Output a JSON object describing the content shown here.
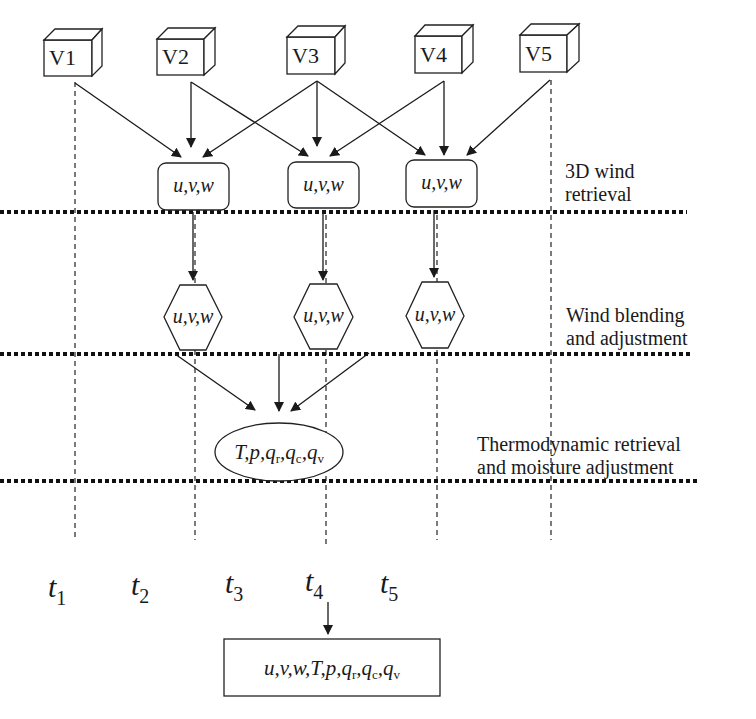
{
  "diagram": {
    "type": "flowchart",
    "volumes": [
      {
        "id": "V1",
        "label": "V1",
        "time": "t1"
      },
      {
        "id": "V2",
        "label": "V2",
        "time": "t2"
      },
      {
        "id": "V3",
        "label": "V3",
        "time": "t3"
      },
      {
        "id": "V4",
        "label": "V4",
        "time": "t4"
      },
      {
        "id": "V5",
        "label": "V5",
        "time": "t5"
      }
    ],
    "wind_retrieval_nodes": [
      {
        "id": "R2",
        "label": "u,v,w",
        "inputs": [
          "V1",
          "V2",
          "V3"
        ]
      },
      {
        "id": "R3",
        "label": "u,v,w",
        "inputs": [
          "V2",
          "V3",
          "V4"
        ]
      },
      {
        "id": "R4",
        "label": "u,v,w",
        "inputs": [
          "V3",
          "V4",
          "V5"
        ]
      }
    ],
    "wind_blending_nodes": [
      {
        "id": "B2",
        "label": "u,v,w",
        "input": "R2"
      },
      {
        "id": "B3",
        "label": "u,v,w",
        "input": "R3"
      },
      {
        "id": "B4",
        "label": "u,v,w",
        "input": "R4"
      }
    ],
    "thermo_node": {
      "id": "TH",
      "label": "T,p,q_r,q_c,q_v",
      "base": "T,p,",
      "q_subs": [
        "r",
        "c",
        "v"
      ],
      "inputs": [
        "B2",
        "B3",
        "B4"
      ]
    },
    "output_node": {
      "id": "OUT",
      "label": "u,v,w,T,p,q_r,q_c,q_v",
      "base": "u,v,w,T,p,",
      "q_subs": [
        "r",
        "c",
        "v"
      ],
      "input": "t3"
    },
    "stages": [
      {
        "line1": "3D wind",
        "line2": "retrieval"
      },
      {
        "line1": "Wind blending",
        "line2": "and adjustment"
      },
      {
        "line1": "Thermodynamic retrieval",
        "line2": "and moisture adjustment"
      }
    ],
    "time_labels": [
      {
        "base": "t",
        "sub": "1"
      },
      {
        "base": "t",
        "sub": "2"
      },
      {
        "base": "t",
        "sub": "3"
      },
      {
        "base": "t",
        "sub": "4"
      },
      {
        "base": "t",
        "sub": "5"
      }
    ],
    "node_text": {
      "uvw": "u,v,w",
      "q": "q"
    }
  }
}
